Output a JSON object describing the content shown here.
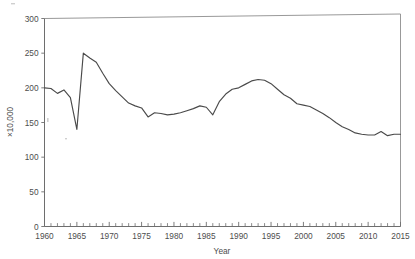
{
  "chart_data": {
    "type": "line",
    "title": "",
    "xlabel": "Year",
    "ylabel": "×10,000",
    "xlim": [
      1960,
      2015
    ],
    "ylim": [
      0,
      300
    ],
    "grid": false,
    "legend": null,
    "y_ticks": [
      0,
      50,
      100,
      150,
      200,
      250,
      300
    ],
    "y_tick_labels": [
      "0",
      "50",
      "100",
      "150",
      "200",
      "250",
      "300"
    ],
    "x_ticks": [
      1960,
      1965,
      1970,
      1975,
      1980,
      1985,
      1990,
      1995,
      2000,
      2005,
      2010,
      2015
    ],
    "x_tick_labels": [
      "1960",
      "1965",
      "1970",
      "1975",
      "1980",
      "1985",
      "1990",
      "1995",
      "2000",
      "2005",
      "2010",
      "2015"
    ],
    "x_minor_tick_step": 1,
    "series": [
      {
        "name": "value",
        "x": [
          1960,
          1961,
          1962,
          1963,
          1964,
          1965,
          1966,
          1967,
          1968,
          1969,
          1970,
          1971,
          1972,
          1973,
          1974,
          1975,
          1976,
          1977,
          1978,
          1979,
          1980,
          1981,
          1982,
          1983,
          1984,
          1985,
          1986,
          1987,
          1988,
          1989,
          1990,
          1991,
          1992,
          1993,
          1994,
          1995,
          1996,
          1997,
          1998,
          1999,
          2000,
          2001,
          2002,
          2003,
          2004,
          2005,
          2006,
          2007,
          2008,
          2009,
          2010,
          2011,
          2012,
          2013,
          2014,
          2015
        ],
        "y": [
          200,
          199,
          192,
          197,
          186,
          140,
          250,
          243,
          237,
          221,
          206,
          196,
          187,
          178,
          174,
          171,
          158,
          164,
          163,
          161,
          162,
          164,
          167,
          170,
          174,
          172,
          161,
          180,
          191,
          198,
          200,
          205,
          210,
          212,
          211,
          206,
          198,
          190,
          185,
          177,
          175,
          173,
          168,
          163,
          157,
          150,
          144,
          140,
          135,
          133,
          132,
          132,
          137,
          131,
          133,
          133
        ]
      }
    ]
  },
  "axis_titles": {
    "x": "Year",
    "y": "×10,000"
  }
}
